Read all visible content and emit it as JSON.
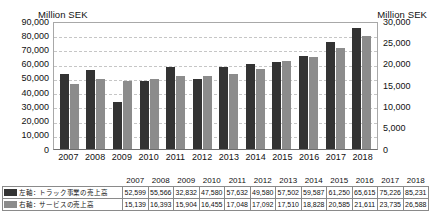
{
  "axis_captions": {
    "left": "Million SEK",
    "right": "Million SEK"
  },
  "legend": {
    "primary": {
      "label": "左軸：トラック事業の売上高",
      "color": "#333333",
      "swatch_name": "primary-color-swatch"
    },
    "secondary": {
      "label": "右軸：サービスの売上高",
      "color": "#8c8c8c",
      "swatch_name": "secondary-color-swatch"
    }
  },
  "chart_data": {
    "type": "bar",
    "title": "",
    "xlabel": "",
    "ylabel": "Million SEK",
    "categories": [
      "2007",
      "2008",
      "2009",
      "2010",
      "2011",
      "2012",
      "2013",
      "2014",
      "2015",
      "2016",
      "2017",
      "2018"
    ],
    "series": [
      {
        "name": "左軸：トラック事業の売上高",
        "axis": "left",
        "color": "#333333",
        "values": [
          52599,
          55566,
          32832,
          47580,
          57632,
          49580,
          57502,
          59587,
          61250,
          65615,
          75226,
          85231
        ]
      },
      {
        "name": "右軸：サービスの売上高",
        "axis": "right",
        "color": "#8c8c8c",
        "values": [
          15139,
          16393,
          15904,
          16455,
          17048,
          17092,
          17510,
          18828,
          20585,
          21611,
          23735,
          26588
        ]
      }
    ],
    "left_axis": {
      "label": "Million SEK",
      "min": 0,
      "max": 90000,
      "step": 10000,
      "ticks": [
        "90,000",
        "80,000",
        "70,000",
        "60,000",
        "50,000",
        "40,000",
        "30,000",
        "20,000",
        "10,000",
        "0"
      ]
    },
    "right_axis": {
      "label": "Million SEK",
      "min": 0,
      "max": 30000,
      "step": 5000,
      "ticks": [
        "30,000",
        "25,000",
        "20,000",
        "15,000",
        "10,000",
        "5,000",
        "0"
      ]
    },
    "grid": true,
    "legend_position": "bottom-table"
  },
  "table": {
    "years": [
      "2007",
      "2008",
      "2009",
      "2010",
      "2011",
      "2012",
      "2013",
      "2014",
      "2015",
      "2016",
      "2017",
      "2018"
    ],
    "row_primary": [
      "52,599",
      "55,566",
      "32,832",
      "47,580",
      "57,632",
      "49,580",
      "57,502",
      "59,587",
      "61,250",
      "65,615",
      "75,226",
      "85,231"
    ],
    "row_secondary": [
      "15,139",
      "16,393",
      "15,904",
      "16,455",
      "17,048",
      "17,092",
      "17,510",
      "18,828",
      "20,585",
      "21,611",
      "23,735",
      "26,588"
    ]
  }
}
